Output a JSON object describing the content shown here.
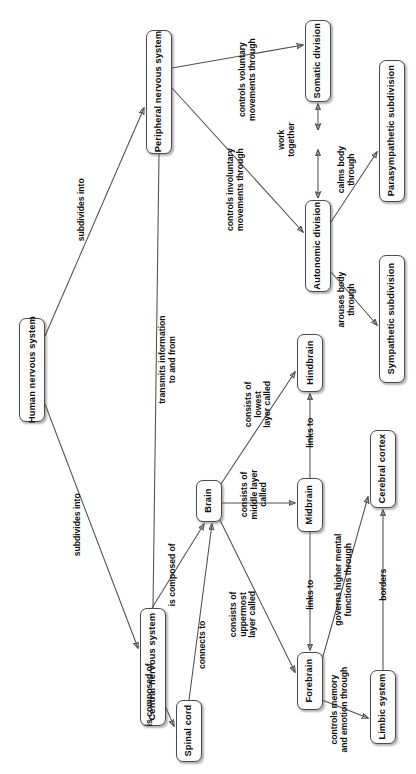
{
  "diagram": {
    "orientation": "rotated-90",
    "node_border_color": "#4a4a4a",
    "edge_color": "#4f4f4f",
    "nodes": [
      {
        "id": "hns",
        "label": "Human nervous system",
        "x": 19,
        "y": 318,
        "w": 26,
        "h": 104
      },
      {
        "id": "pns",
        "label": "Peripheral nervous system",
        "x": 146,
        "y": 30,
        "w": 26,
        "h": 124
      },
      {
        "id": "cns",
        "label": "Central nervous system",
        "x": 140,
        "y": 608,
        "w": 26,
        "h": 118
      },
      {
        "id": "som",
        "label": "Somatic division",
        "x": 305,
        "y": 20,
        "w": 26,
        "h": 82
      },
      {
        "id": "aut",
        "label": "Autonomic division",
        "x": 305,
        "y": 200,
        "w": 26,
        "h": 92
      },
      {
        "id": "para",
        "label": "Parasympathetic subdivision",
        "x": 379,
        "y": 60,
        "w": 26,
        "h": 142
      },
      {
        "id": "symp",
        "label": "Sympathetic subdivision",
        "x": 379,
        "y": 255,
        "w": 26,
        "h": 128
      },
      {
        "id": "brain",
        "label": "Brain",
        "x": 196,
        "y": 480,
        "w": 26,
        "h": 42
      },
      {
        "id": "spinal",
        "label": "Spinal cord",
        "x": 176,
        "y": 700,
        "w": 26,
        "h": 62
      },
      {
        "id": "hind",
        "label": "Hindbrain",
        "x": 297,
        "y": 334,
        "w": 26,
        "h": 58
      },
      {
        "id": "mid",
        "label": "Midbrain",
        "x": 297,
        "y": 478,
        "w": 26,
        "h": 54
      },
      {
        "id": "fore",
        "label": "Forebrain",
        "x": 297,
        "y": 652,
        "w": 26,
        "h": 58
      },
      {
        "id": "cort",
        "label": "Cerebral cortex",
        "x": 370,
        "y": 430,
        "w": 26,
        "h": 78
      },
      {
        "id": "limb",
        "label": "Limbic system",
        "x": 370,
        "y": 670,
        "w": 26,
        "h": 74
      }
    ],
    "edges": [
      {
        "from": "hns",
        "to": "pns",
        "label": "subdivides into",
        "lx": 82,
        "ly": 205,
        "lw": 80
      },
      {
        "from": "hns",
        "to": "cns",
        "label": "subdivides into",
        "lx": 78,
        "ly": 520,
        "lw": 80
      },
      {
        "from": "pns",
        "to": "cns",
        "label": "transmits information\nto and from",
        "lx": 168,
        "ly": 350,
        "lw": 106
      },
      {
        "from": "pns",
        "to": "som",
        "label": "controls voluntary\nmovements through",
        "lx": 248,
        "ly": 70,
        "lw": 110
      },
      {
        "from": "pns",
        "to": "aut",
        "label": "controls involuntary\nmovements through",
        "lx": 236,
        "ly": 180,
        "lw": 116
      },
      {
        "from": "aut",
        "to": "som",
        "label": "work\ntogether",
        "lx": 287,
        "ly": 130,
        "lw": 48
      },
      {
        "from": "aut",
        "to": "para",
        "label": "calms body\nthrough",
        "lx": 347,
        "ly": 160,
        "lw": 62
      },
      {
        "from": "aut",
        "to": "symp",
        "label": "arouses body\nthrough",
        "lx": 347,
        "ly": 290,
        "lw": 72
      },
      {
        "from": "cns",
        "to": "brain",
        "label": "is composed of",
        "lx": 173,
        "ly": 570,
        "lw": 74
      },
      {
        "from": "cns",
        "to": "spinal",
        "label": "is composed of",
        "lx": 150,
        "ly": 690,
        "lw": 74
      },
      {
        "from": "spinal",
        "to": "brain",
        "label": "connects to",
        "lx": 203,
        "ly": 640,
        "lw": 62
      },
      {
        "from": "brain",
        "to": "hind",
        "label": "consists of\nlowest\nlayer called",
        "lx": 258,
        "ly": 390,
        "lw": 62
      },
      {
        "from": "brain",
        "to": "mid",
        "label": "consists of\nmiddle layer\ncalled",
        "lx": 254,
        "ly": 480,
        "lw": 68
      },
      {
        "from": "brain",
        "to": "fore",
        "label": "consists of\nuppermost\nlayer called",
        "lx": 243,
        "ly": 600,
        "lw": 68
      },
      {
        "from": "mid",
        "to": "hind",
        "label": "links to",
        "lx": 311,
        "ly": 428,
        "lw": 44
      },
      {
        "from": "mid",
        "to": "fore",
        "label": "links to",
        "lx": 311,
        "ly": 590,
        "lw": 44
      },
      {
        "from": "fore",
        "to": "cort",
        "label": "governs higher mental\nfunctions through",
        "lx": 344,
        "ly": 570,
        "lw": 120
      },
      {
        "from": "fore",
        "to": "limb",
        "label": "controls memory\nand emotion through",
        "lx": 340,
        "ly": 700,
        "lw": 104
      },
      {
        "from": "limb",
        "to": "cort",
        "label": "borders",
        "lx": 384,
        "ly": 580,
        "lw": 44
      }
    ]
  }
}
